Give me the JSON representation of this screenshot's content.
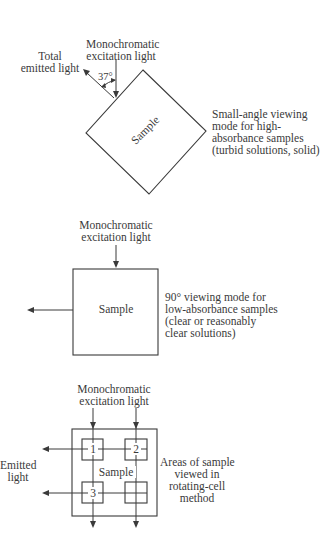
{
  "panel_top": {
    "excitation_label_1": "Monochromatic",
    "excitation_label_2": "excitation light",
    "emitted_label_1": "Total",
    "emitted_label_2": "emitted light",
    "angle_label": "37°",
    "sample_label": "Sample",
    "description": [
      "Small-angle viewing",
      "mode for high-",
      "absorbance samples",
      "(turbid solutions, solid)"
    ]
  },
  "panel_middle": {
    "excitation_label_1": "Monochromatic",
    "excitation_label_2": "excitation light",
    "sample_label": "Sample",
    "description": [
      "90° viewing mode for",
      "low-absorbance samples",
      "(clear or reasonably",
      "clear solutions)"
    ]
  },
  "panel_bottom": {
    "excitation_label_1": "Monochromatic",
    "excitation_label_2": "excitation light",
    "emitted_label_1": "Emitted",
    "emitted_label_2": "light",
    "sample_label": "Sample",
    "area_numbers": [
      "1",
      "2",
      "3"
    ],
    "description": [
      "Areas of sample",
      "viewed in",
      "rotating-cell",
      "method"
    ]
  },
  "colors": {
    "line": "#3a3a3a",
    "background": "#ffffff"
  }
}
